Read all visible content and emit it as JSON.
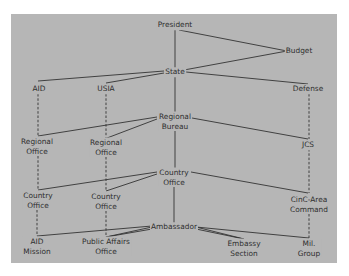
{
  "diagram": {
    "background_color": "#b6b6b6",
    "line_color": "#333333",
    "text_color": "#2e2e2e",
    "nodes": [
      {
        "id": "president",
        "lines": [
          "President"
        ],
        "x": 175,
        "y": 25
      },
      {
        "id": "budget",
        "lines": [
          "Budget"
        ],
        "x": 298,
        "y": 51
      },
      {
        "id": "state",
        "lines": [
          "State"
        ],
        "x": 175,
        "y": 72
      },
      {
        "id": "aid",
        "lines": [
          "AID"
        ],
        "x": 39,
        "y": 90
      },
      {
        "id": "usia",
        "lines": [
          "USIA"
        ],
        "x": 106,
        "y": 90
      },
      {
        "id": "defense",
        "lines": [
          "Defense"
        ],
        "x": 308,
        "y": 90
      },
      {
        "id": "regional-bureau",
        "lines": [
          "Regional",
          "Bureau"
        ],
        "x": 175,
        "y": 121
      },
      {
        "id": "aid-regional-office",
        "lines": [
          "Regional",
          "Office"
        ],
        "x": 37,
        "y": 146
      },
      {
        "id": "usia-regional-office",
        "lines": [
          "Regional",
          "Office"
        ],
        "x": 106,
        "y": 147
      },
      {
        "id": "jcs",
        "lines": [
          "JCS"
        ],
        "x": 308,
        "y": 145
      },
      {
        "id": "country-office-center",
        "lines": [
          "Country",
          "Office"
        ],
        "x": 174,
        "y": 177
      },
      {
        "id": "aid-country-office",
        "lines": [
          "Country",
          "Office"
        ],
        "x": 38,
        "y": 200
      },
      {
        "id": "usia-country-office",
        "lines": [
          "Country",
          "Office"
        ],
        "x": 106,
        "y": 201
      },
      {
        "id": "cinc-area-command",
        "lines": [
          "CinC-Area",
          "Command"
        ],
        "x": 309,
        "y": 204
      },
      {
        "id": "ambassador",
        "lines": [
          "Ambassador"
        ],
        "x": 174,
        "y": 227
      },
      {
        "id": "aid-mission",
        "lines": [
          "AID",
          "Mission"
        ],
        "x": 37,
        "y": 245
      },
      {
        "id": "public-affairs-office",
        "lines": [
          "Public Affairs",
          "Office"
        ],
        "x": 106,
        "y": 246
      },
      {
        "id": "embassy-section",
        "lines": [
          "Embassy",
          "Section"
        ],
        "x": 244,
        "y": 248
      },
      {
        "id": "mil-group",
        "lines": [
          "Mil.",
          "Group"
        ],
        "x": 309,
        "y": 248
      }
    ],
    "edges_solid": [
      {
        "from": "president",
        "to": "state"
      },
      {
        "from": "president",
        "to": "budget"
      },
      {
        "from": "state",
        "to": "budget"
      },
      {
        "from": "state",
        "to": "aid"
      },
      {
        "from": "state",
        "to": "usia"
      },
      {
        "from": "state",
        "to": "defense"
      },
      {
        "from": "state",
        "to": "regional-bureau"
      },
      {
        "from": "regional-bureau",
        "to": "aid-regional-office"
      },
      {
        "from": "regional-bureau",
        "to": "usia-regional-office"
      },
      {
        "from": "regional-bureau",
        "to": "jcs"
      },
      {
        "from": "regional-bureau",
        "to": "country-office-center"
      },
      {
        "from": "country-office-center",
        "to": "aid-country-office"
      },
      {
        "from": "country-office-center",
        "to": "usia-country-office"
      },
      {
        "from": "country-office-center",
        "to": "cinc-area-command"
      },
      {
        "from": "country-office-center",
        "to": "ambassador"
      },
      {
        "from": "ambassador",
        "to": "aid-mission"
      },
      {
        "from": "ambassador",
        "to": "public-affairs-office"
      },
      {
        "from": "ambassador",
        "to": "embassy-section"
      },
      {
        "from": "ambassador",
        "to": "mil-group"
      }
    ],
    "edges_dashed": [
      {
        "from": "aid",
        "to": "aid-regional-office"
      },
      {
        "from": "aid-regional-office",
        "to": "aid-country-office"
      },
      {
        "from": "aid-country-office",
        "to": "aid-mission"
      },
      {
        "from": "usia",
        "to": "usia-regional-office"
      },
      {
        "from": "usia-regional-office",
        "to": "usia-country-office"
      },
      {
        "from": "usia-country-office",
        "to": "public-affairs-office"
      },
      {
        "from": "defense",
        "to": "jcs"
      },
      {
        "from": "jcs",
        "to": "cinc-area-command"
      },
      {
        "from": "cinc-area-command",
        "to": "mil-group"
      }
    ]
  },
  "labels": {
    "president": "President",
    "budget": "Budget",
    "state": "State",
    "aid": "AID",
    "usia": "USIA",
    "defense": "Defense",
    "regional_bureau_1": "Regional",
    "regional_bureau_2": "Bureau",
    "aid_regional_office_1": "Regional",
    "aid_regional_office_2": "Office",
    "usia_regional_office_1": "Regional",
    "usia_regional_office_2": "Office",
    "jcs": "JCS",
    "country_office_center_1": "Country",
    "country_office_center_2": "Office",
    "aid_country_office_1": "Country",
    "aid_country_office_2": "Office",
    "usia_country_office_1": "Country",
    "usia_country_office_2": "Office",
    "cinc_area_command_1": "CinC-Area",
    "cinc_area_command_2": "Command",
    "ambassador": "Ambassador",
    "aid_mission_1": "AID",
    "aid_mission_2": "Mission",
    "public_affairs_office_1": "Public Affairs",
    "public_affairs_office_2": "Office",
    "embassy_section_1": "Embassy",
    "embassy_section_2": "Section",
    "mil_group_1": "Mil.",
    "mil_group_2": "Group"
  }
}
